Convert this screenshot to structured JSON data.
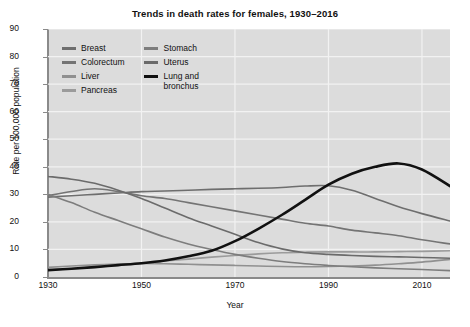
{
  "chart_data": {
    "type": "line",
    "title": "Trends in death rates for females, 1930–2016",
    "xlabel": "Year",
    "ylabel": "Rate per 100,000 population",
    "xlim": [
      1930,
      2016
    ],
    "ylim": [
      0,
      90
    ],
    "ytick_labels": [
      "0",
      "10",
      "20",
      "30",
      "40",
      "50",
      "60",
      "70",
      "80",
      "90"
    ],
    "yticks": [
      0,
      10,
      20,
      30,
      40,
      50,
      60,
      70,
      80,
      90
    ],
    "xtick_labels": [
      "1930",
      "1950",
      "1970",
      "1990",
      "2010"
    ],
    "xticks": [
      1930,
      1950,
      1970,
      1990,
      2010
    ],
    "grid": true,
    "legend_position": "upper-left-inside",
    "plot_background": "#dcdcdc",
    "series": [
      {
        "name": "Breast",
        "color": "#6e6e6e",
        "width": 1.6,
        "x": [
          1930,
          1935,
          1940,
          1945,
          1950,
          1955,
          1960,
          1965,
          1970,
          1975,
          1980,
          1985,
          1990,
          1995,
          2000,
          2005,
          2010,
          2016
        ],
        "values": [
          29.0,
          29.5,
          30.0,
          30.5,
          31.0,
          31.2,
          31.5,
          31.8,
          32.0,
          32.2,
          32.5,
          33.0,
          33.1,
          31.5,
          28.5,
          25.5,
          23.0,
          20.3
        ]
      },
      {
        "name": "Colorectum",
        "color": "#747474",
        "width": 1.6,
        "x": [
          1930,
          1935,
          1940,
          1945,
          1950,
          1955,
          1960,
          1965,
          1970,
          1975,
          1980,
          1985,
          1990,
          1995,
          2000,
          2005,
          2010,
          2016
        ],
        "values": [
          29.5,
          31.0,
          32.0,
          31.0,
          29.5,
          28.5,
          27.0,
          25.5,
          24.0,
          22.5,
          21.0,
          19.5,
          18.5,
          17.0,
          16.0,
          15.0,
          13.5,
          12.0
        ]
      },
      {
        "name": "Liver",
        "color": "#909090",
        "width": 1.6,
        "x": [
          1930,
          1935,
          1940,
          1945,
          1950,
          1955,
          1960,
          1965,
          1970,
          1975,
          1980,
          1985,
          1990,
          1995,
          2000,
          2005,
          2010,
          2016
        ],
        "values": [
          3.5,
          4.0,
          4.4,
          4.7,
          4.9,
          4.8,
          4.6,
          4.4,
          4.2,
          4.0,
          3.8,
          3.7,
          3.8,
          4.0,
          4.3,
          4.8,
          5.4,
          6.4
        ]
      },
      {
        "name": "Pancreas",
        "color": "#9b9b9b",
        "width": 1.6,
        "x": [
          1930,
          1935,
          1940,
          1945,
          1950,
          1955,
          1960,
          1965,
          1970,
          1975,
          1980,
          1985,
          1990,
          1995,
          2000,
          2005,
          2010,
          2016
        ],
        "values": [
          2.5,
          3.0,
          3.6,
          4.3,
          5.0,
          5.8,
          6.5,
          7.2,
          7.8,
          8.4,
          8.8,
          9.0,
          9.1,
          9.1,
          9.1,
          9.2,
          9.3,
          9.5
        ]
      },
      {
        "name": "Stomach",
        "color": "#7d7d7d",
        "width": 1.6,
        "x": [
          1930,
          1935,
          1940,
          1945,
          1950,
          1955,
          1960,
          1965,
          1970,
          1975,
          1980,
          1985,
          1990,
          1995,
          2000,
          2005,
          2010,
          2016
        ],
        "values": [
          30.0,
          27.0,
          23.5,
          20.5,
          17.5,
          14.5,
          12.0,
          10.0,
          8.2,
          6.8,
          5.6,
          4.8,
          4.2,
          3.7,
          3.3,
          3.0,
          2.7,
          2.3
        ]
      },
      {
        "name": "Uterus",
        "color": "#6b6b6b",
        "width": 1.6,
        "x": [
          1930,
          1935,
          1940,
          1945,
          1950,
          1955,
          1960,
          1965,
          1970,
          1975,
          1980,
          1985,
          1990,
          1995,
          2000,
          2005,
          2010,
          2016
        ],
        "values": [
          36.5,
          35.5,
          34.0,
          31.5,
          28.5,
          25.0,
          21.5,
          18.5,
          15.5,
          12.5,
          10.2,
          8.8,
          8.2,
          7.8,
          7.5,
          7.3,
          7.1,
          6.8
        ]
      },
      {
        "name": "Lung and bronchus",
        "color": "#111111",
        "width": 2.6,
        "x": [
          1930,
          1935,
          1940,
          1945,
          1950,
          1955,
          1960,
          1965,
          1970,
          1975,
          1980,
          1985,
          1990,
          1995,
          2000,
          2005,
          2010,
          2016
        ],
        "values": [
          2.5,
          3.0,
          3.6,
          4.3,
          5.0,
          6.0,
          7.5,
          9.5,
          13.0,
          17.5,
          22.5,
          28.0,
          33.5,
          37.5,
          40.0,
          41.2,
          39.0,
          33.0
        ]
      }
    ]
  },
  "legend": {
    "columns": [
      [
        {
          "label": "Breast",
          "color": "#6e6e6e",
          "thick": false
        },
        {
          "label": "Colorectum",
          "color": "#747474",
          "thick": false
        },
        {
          "label": "Liver",
          "color": "#909090",
          "thick": false
        },
        {
          "label": "Pancreas",
          "color": "#9b9b9b",
          "thick": false
        }
      ],
      [
        {
          "label": "Stomach",
          "color": "#7d7d7d",
          "thick": false
        },
        {
          "label": "Uterus",
          "color": "#6b6b6b",
          "thick": false
        },
        {
          "label": "Lung and\nbronchus",
          "color": "#111111",
          "thick": true
        }
      ]
    ]
  }
}
